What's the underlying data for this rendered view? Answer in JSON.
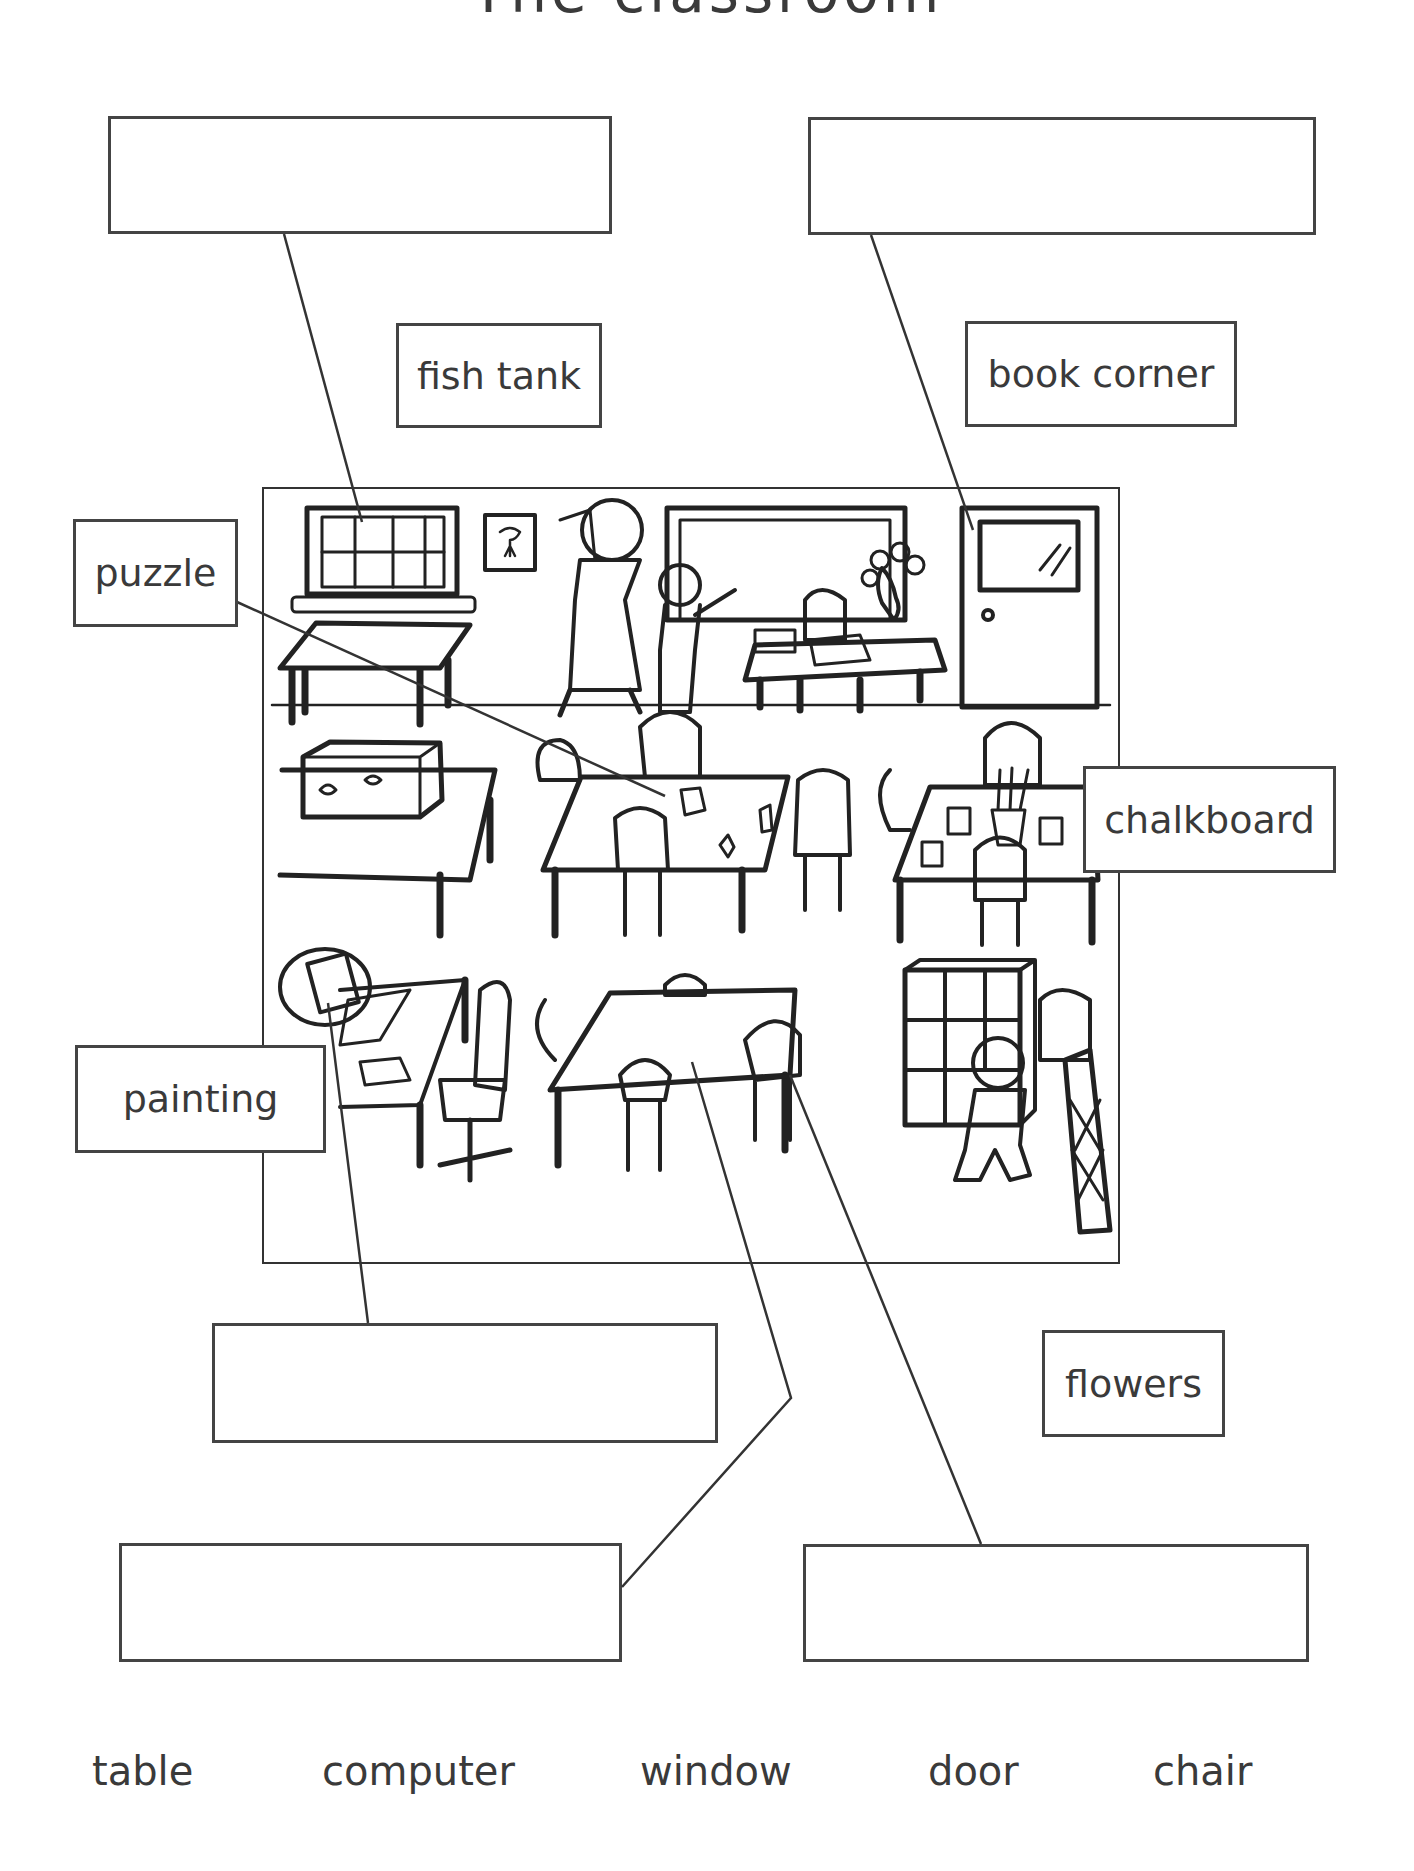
{
  "worksheet": {
    "title": "The classroom"
  },
  "labels": {
    "fish_tank": "fish tank",
    "book_corner": "book corner",
    "puzzle": "puzzle",
    "chalkboard": "chalkboard",
    "painting": "painting",
    "flowers": "flowers"
  },
  "answer_boxes": [
    {
      "id": "top-left",
      "value": ""
    },
    {
      "id": "top-right",
      "value": ""
    },
    {
      "id": "middle",
      "value": ""
    },
    {
      "id": "bottom-left",
      "value": ""
    },
    {
      "id": "bottom-right",
      "value": ""
    }
  ],
  "word_bank": [
    "table",
    "computer",
    "window",
    "door",
    "chair"
  ],
  "colors": {
    "ink": "#333333",
    "box_border": "#444444",
    "background": "#ffffff"
  }
}
